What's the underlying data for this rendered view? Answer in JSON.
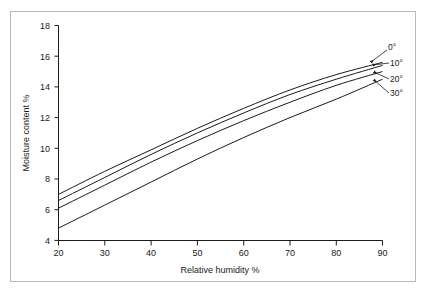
{
  "chart_data": {
    "type": "line",
    "title": "",
    "xlabel": "Relative humidity %",
    "ylabel": "Moisture content %",
    "xlim": [
      20,
      90
    ],
    "ylim": [
      4,
      18
    ],
    "xticks": [
      20,
      30,
      40,
      50,
      60,
      70,
      80,
      90
    ],
    "yticks": [
      4,
      6,
      8,
      10,
      12,
      14,
      16,
      18
    ],
    "grid": false,
    "legend_position": "right-inline-annotations",
    "x": [
      20,
      30,
      40,
      50,
      60,
      70,
      80,
      90
    ],
    "series": [
      {
        "name": "0°",
        "label": "0°",
        "values": [
          7.0,
          8.5,
          9.9,
          11.3,
          12.6,
          13.8,
          14.8,
          15.6
        ]
      },
      {
        "name": "10°",
        "label": "10°",
        "values": [
          6.6,
          8.1,
          9.6,
          11.0,
          12.3,
          13.5,
          14.5,
          15.4
        ]
      },
      {
        "name": "20°",
        "label": "20°",
        "values": [
          6.1,
          7.6,
          9.1,
          10.5,
          11.8,
          13.0,
          14.1,
          15.0
        ]
      },
      {
        "name": "30°",
        "label": "30°",
        "values": [
          4.8,
          6.3,
          7.8,
          9.3,
          10.7,
          12.0,
          13.2,
          14.5
        ]
      }
    ],
    "annotations": [
      {
        "text": "0°",
        "points_to_series": "0°"
      },
      {
        "text": "10°",
        "points_to_series": "10°"
      },
      {
        "text": "20°",
        "points_to_series": "20°"
      },
      {
        "text": "30°",
        "points_to_series": "30°"
      }
    ],
    "colors": {
      "line": "#1a1a1a",
      "frame": "#b9b9b9",
      "background": "#ffffff"
    }
  },
  "tick_labels": {
    "x": [
      "20",
      "30",
      "40",
      "50",
      "60",
      "70",
      "80",
      "90"
    ],
    "y": [
      "4",
      "6",
      "8",
      "10",
      "12",
      "14",
      "16",
      "18"
    ]
  },
  "axis_titles": {
    "x": "Relative humidity %",
    "y": "Moisture content %"
  },
  "series_labels": {
    "s0": "0°",
    "s1": "10°",
    "s2": "20°",
    "s3": "30°"
  }
}
